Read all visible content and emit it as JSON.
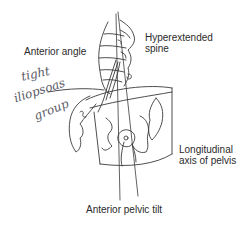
{
  "diagram": {
    "labels": {
      "anterior_angle": "Anterior angle",
      "hyperextended_spine": "Hyperextended\nspine",
      "longitudinal_axis": "Longitudinal\naxis of pelvis",
      "anterior_pelvic_tilt": "Anterior pelvic tilt"
    },
    "handwritten_annotation": {
      "line1": "tight",
      "line2": "iliopsoas",
      "line3": "group"
    },
    "colors": {
      "ink": "#3a3a3a",
      "handwriting": "#5a5a66",
      "background": "#ffffff"
    }
  }
}
